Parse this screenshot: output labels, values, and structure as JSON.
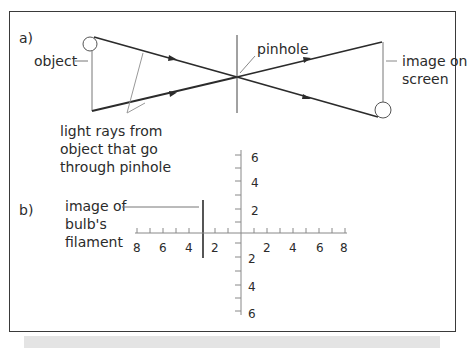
{
  "figure": {
    "part_a": {
      "label": "a)",
      "object_label": "object",
      "pinhole_label": "pinhole",
      "image_label_line1": "image on",
      "image_label_line2": "screen",
      "rays_label_line1": "light rays from",
      "rays_label_line2": "object that go",
      "rays_label_line3": "through pinhole"
    },
    "part_b": {
      "label": "b)",
      "filament_label_line1": "image of",
      "filament_label_line2": "bulb's",
      "filament_label_line3": "filament",
      "x_tick_labels_left": [
        "8",
        "6",
        "4",
        "2"
      ],
      "x_tick_labels_right": [
        "2",
        "4",
        "6",
        "8"
      ],
      "y_tick_labels_top": [
        "6",
        "4",
        "2"
      ],
      "y_tick_labels_bottom": [
        "2",
        "4",
        "6"
      ]
    }
  },
  "colors": {
    "line": "#2b2b2b",
    "leader": "#8a8a8a",
    "frame": "#3a3a3a"
  }
}
